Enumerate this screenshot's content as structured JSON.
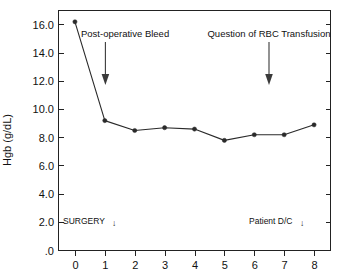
{
  "chart_data": {
    "type": "line",
    "title": "",
    "subtitle": "",
    "xlabel": "",
    "ylabel": "Hgb (g/dL)",
    "x": [
      0,
      1,
      2,
      3,
      4,
      5,
      6,
      7,
      8
    ],
    "values": [
      16.2,
      9.2,
      8.5,
      8.7,
      8.6,
      7.8,
      8.2,
      8.2,
      8.9
    ],
    "series": [
      {
        "name": "Hgb",
        "values": [
          16.2,
          9.2,
          8.5,
          8.7,
          8.6,
          7.8,
          8.2,
          8.2,
          8.9
        ]
      }
    ],
    "xlim": [
      -0.55,
      8.55
    ],
    "ylim": [
      0,
      17.0
    ],
    "xticks": [
      "0",
      "1",
      "2",
      "3",
      "4",
      "5",
      "6",
      "7",
      "8"
    ],
    "xtick_values": [
      0,
      1,
      2,
      3,
      4,
      5,
      6,
      7,
      8
    ],
    "yticks": [
      ".0",
      "2.0",
      "4.0",
      "6.0",
      "8.0",
      "10.0",
      "12.0",
      "14.0",
      "16.0"
    ],
    "ytick_values": [
      0,
      2,
      4,
      6,
      8,
      10,
      12,
      14,
      16
    ],
    "grid": false,
    "legend": "none",
    "marker": "filled-circle",
    "line_color": "#2a2a2a",
    "marker_color": "#2a2a2a",
    "background": "#ffffff",
    "annotations": [
      {
        "text": "Post-operative Bleed",
        "arrow_x": 1,
        "arrow_y_top": 15.0,
        "arrow_y_tip": 11.2,
        "label_x": 1.15,
        "label_y": 15.6,
        "anchor": "start"
      },
      {
        "text": "Question of RBC Transfusion",
        "arrow_x": 7,
        "arrow_y_top": 15.0,
        "arrow_y_tip": 11.2,
        "label_x": 7,
        "label_y": 15.6,
        "anchor": "middle"
      }
    ],
    "event_labels": [
      {
        "text": "SURGERY",
        "arrow": "↓",
        "x": 0,
        "y": 2.0,
        "anchor": "start"
      },
      {
        "text": "Patient D/C",
        "arrow": "↓",
        "x": 6.35,
        "y": 2.0,
        "anchor": "start"
      }
    ]
  }
}
